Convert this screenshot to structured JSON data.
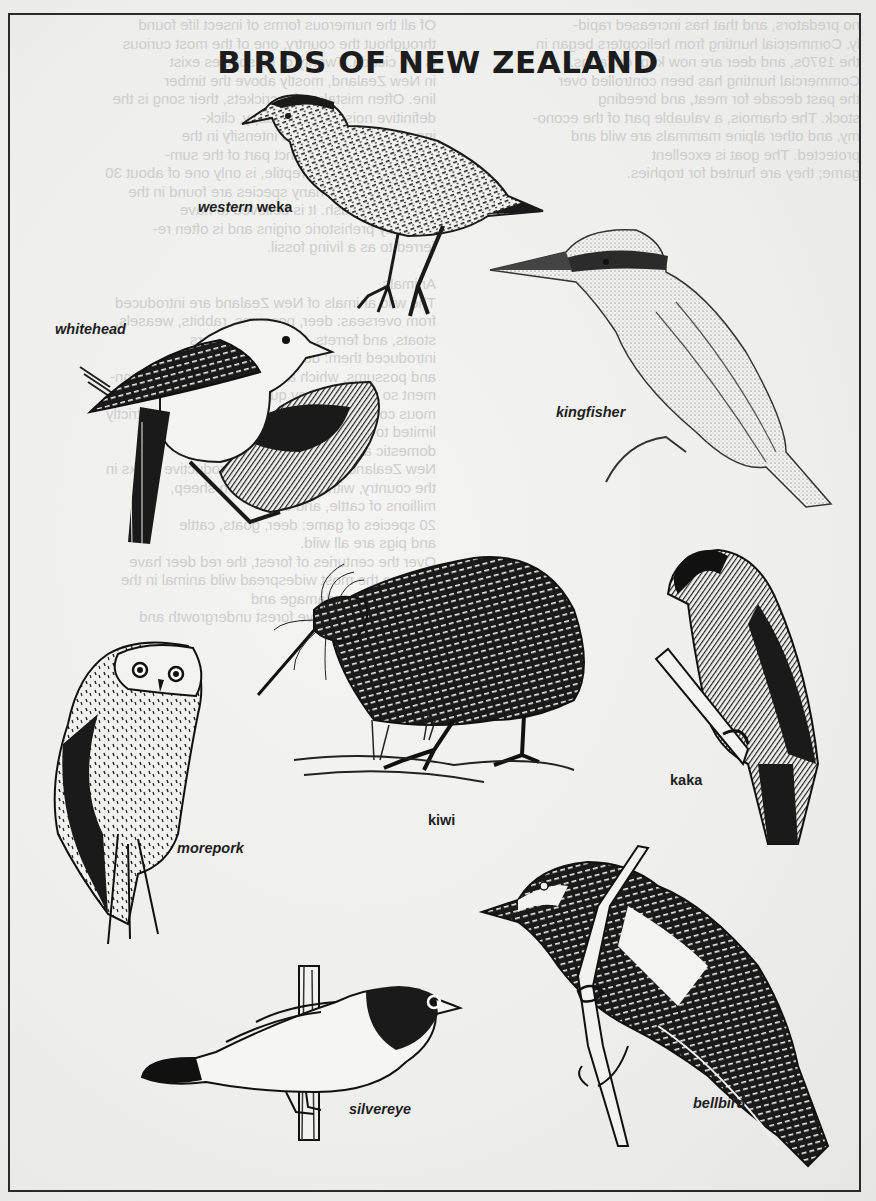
{
  "poster": {
    "title": "BIRDS OF NEW ZEALAND",
    "border_color": "#2a2a2a",
    "ink_color": "#1c1c1c",
    "paper_color": "#efefed"
  },
  "birds": [
    {
      "id": "western-weka",
      "label_prefix": "western",
      "label_suffix": " weka"
    },
    {
      "id": "whitehead",
      "label": "whitehead"
    },
    {
      "id": "kingfisher",
      "label": "kingfisher"
    },
    {
      "id": "kiwi",
      "label": "kiwi"
    },
    {
      "id": "kaka",
      "label": "kaka"
    },
    {
      "id": "morepork",
      "label": "morepork"
    },
    {
      "id": "silvereye",
      "label": "silvereye"
    },
    {
      "id": "bellbird",
      "label": "bellbird"
    }
  ],
  "show_through_text": {
    "left_column": "no predators, and that has increased rapid-\nly. Commercial hunting from helicopters began in\nthe 1970s, and deer are now kept on farms.\nCommercial hunting has been controlled over\nthe past decade for meat, and breeding\nstock. The chamois, a valuable part of the econo-\nmy, and other alpine mammals are wild and\nprotected. The goat is excellent\ngame; they are hunted for trophies.",
    "right_column": "Of all the numerous forms of insect life found\nthroughout the country, one of the most curious\nis the cicada. Twenty or so species exist\nin New Zealand, mostly above the timber\nline. Often mistaken for crickets, their song is the\ndefinitive noise: a loud, raspy, click-\ning noise that seems to intensify in the\nevening hours, a distinct part of the sum-\nmer. The tuatara, a reptile, is only one of about 30\nkinds of lizards; many species are found in the\nforests and bush. It is believed to have\ndistinctly prehistoric origins and is often re-\nferred to as a living fossil.\n\nAnimals\nThe wild animals of New Zealand are introduced\nfrom overseas: deer, possums, rabbits, weasels,\nstoats, and ferrets. European settlers\nintroduced them: deer, rabbits, goats,\nand possums, which adapted to the new environ-\nment so well that they quickly became an enor-\nmous commercial problem. Deer had to be strictly\nlimited to control the populations. The\ndomestic animals also adapted well to\nNew Zealand; there are large, productive flocks in\nthe country, with some 70 million sheep,\nmillions of cattle, and over\n20 species of game: deer, goats, cattle\nand pigs are all wild.\nOver the centuries of forest, the red deer have\nbecome the most widespread wild animal in the\nforest, causing damage and\ndestroying the native forest undergrowth and"
  }
}
